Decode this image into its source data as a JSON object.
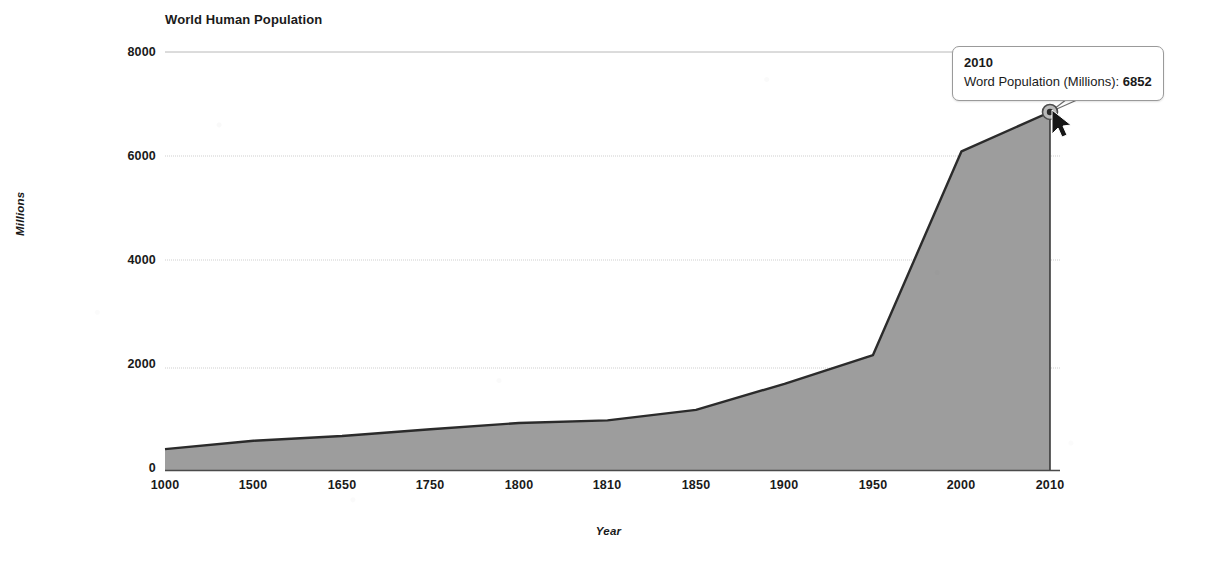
{
  "chart_data": {
    "type": "area",
    "title": "World Human Population",
    "xlabel": "Year",
    "ylabel": "Millions",
    "categories": [
      "1000",
      "1500",
      "1650",
      "1750",
      "1800",
      "1810",
      "1850",
      "1900",
      "1950",
      "2000",
      "2010"
    ],
    "values": [
      400,
      560,
      650,
      780,
      900,
      950,
      1150,
      1650,
      2200,
      6100,
      6852
    ],
    "series": [
      {
        "name": "Word Population (Millions)",
        "values": [
          400,
          560,
          650,
          780,
          900,
          950,
          1150,
          1650,
          2200,
          6100,
          6852
        ]
      }
    ],
    "y_ticks": [
      "0",
      "2000",
      "4000",
      "6000",
      "8000"
    ],
    "y_tick_values": [
      0,
      2000,
      4000,
      6000,
      8000
    ],
    "ylim": [
      0,
      8000
    ],
    "grid": true,
    "legend": "none",
    "area_fill_color": "#9b9b9b",
    "line_color": "#2b2b2b",
    "gridline_color": "#c9c9c9",
    "axis_color": "#555555",
    "background_color": "#ffffff"
  },
  "tooltip": {
    "title": "2010",
    "series_label": "Word Population (Millions):",
    "value": "6852",
    "border_color": "#9a9a9a"
  },
  "marker": {
    "point_label": "2010",
    "point_value": "6852"
  },
  "cursor": {
    "name": "mouse-pointer"
  }
}
